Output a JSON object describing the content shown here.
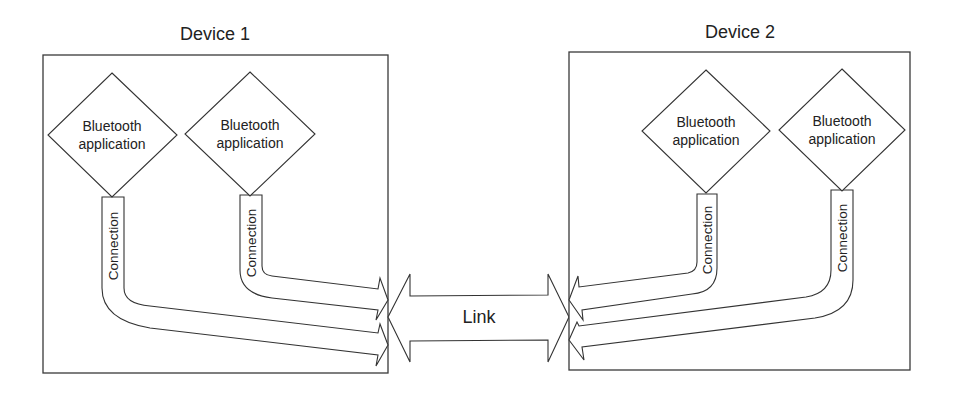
{
  "diagram": {
    "devices": [
      {
        "title": "Device 1",
        "applications": [
          {
            "line1": "Bluetooth",
            "line2": "application"
          },
          {
            "line1": "Bluetooth",
            "line2": "application"
          }
        ],
        "connections": [
          "Connection",
          "Connection"
        ]
      },
      {
        "title": "Device 2",
        "applications": [
          {
            "line1": "Bluetooth",
            "line2": "application"
          },
          {
            "line1": "Bluetooth",
            "line2": "application"
          }
        ],
        "connections": [
          "Connection",
          "Connection"
        ]
      }
    ],
    "link_label": "Link",
    "colors": {
      "stroke": "#333333",
      "background": "#ffffff",
      "text": "#222222"
    }
  }
}
